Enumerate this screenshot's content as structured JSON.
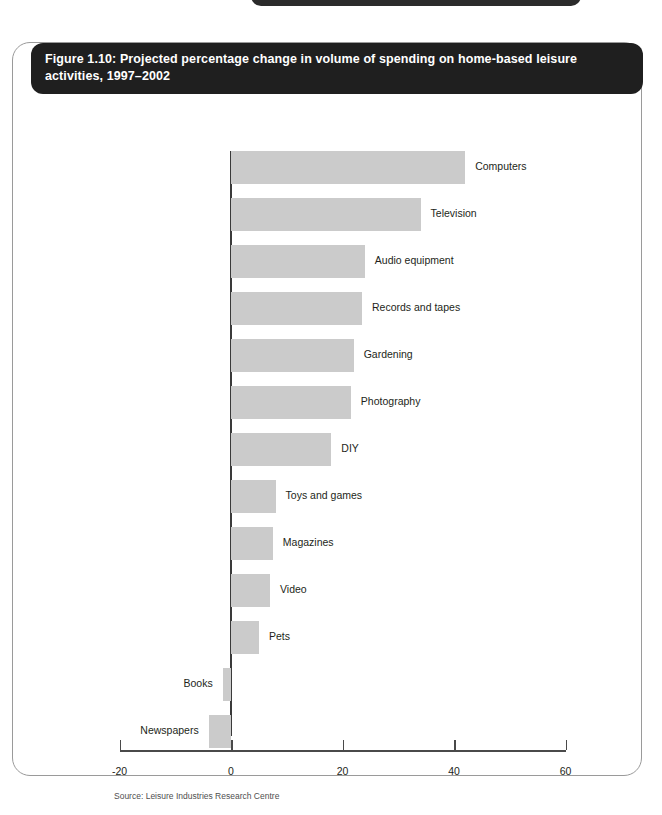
{
  "page": {
    "background": "#ffffff",
    "panel_border_color": "#9a9a9a",
    "header_background": "#1f1f1f",
    "header_text_color": "#ffffff",
    "bar_color": "#cbcbcb",
    "axis_color": "#4a4a4a"
  },
  "figure": {
    "title": "Figure 1.10: Projected percentage change in volume of spending on home-based leisure activities, 1997–2002",
    "source": "Source: Leisure Industries Research Centre"
  },
  "chart_data": {
    "type": "bar",
    "orientation": "horizontal",
    "title": "Figure 1.10: Projected percentage change in volume of spending on home-based leisure activities, 1997–2002",
    "xlabel": "",
    "ylabel": "",
    "xlim": [
      -20,
      60
    ],
    "xticks": [
      -20,
      0,
      20,
      40,
      60
    ],
    "xtick_labels": [
      "-20",
      "0",
      "20",
      "40",
      "60"
    ],
    "grid": false,
    "legend": false,
    "source": "Source: Leisure Industries Research Centre",
    "categories": [
      "Computers",
      "Television",
      "Audio equipment",
      "Records and tapes",
      "Gardening",
      "Photography",
      "DIY",
      "Toys and games",
      "Magazines",
      "Video",
      "Pets",
      "Books",
      "Newspapers"
    ],
    "values": [
      42,
      34,
      24,
      23.5,
      22,
      21.5,
      18,
      8,
      7.5,
      7,
      5,
      -1.5,
      -4
    ]
  }
}
